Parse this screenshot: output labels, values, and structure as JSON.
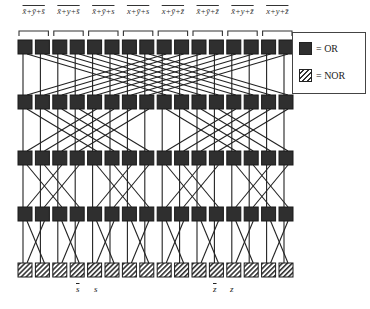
{
  "diagram": {
    "type": "butterfly logic network",
    "columns": 16,
    "rows": [
      {
        "kind": "OR",
        "y": 40
      },
      {
        "kind": "OR",
        "y": 95
      },
      {
        "kind": "OR",
        "y": 151
      },
      {
        "kind": "OR",
        "y": 207
      },
      {
        "kind": "NOR",
        "y": 263
      }
    ],
    "gate_size": 14,
    "x0": 18,
    "pitch": 17.4,
    "colors": {
      "or_fill": "#2f2f2f",
      "line": "#222222",
      "nor_hatch": "#333333"
    }
  },
  "top_labels": [
    "x̄+ȳ+s̄",
    "x̄+y+s̄",
    "x̄+ȳ+s",
    "x+ȳ+s",
    "x+ȳ+z̄",
    "x̄+ȳ+z̄",
    "x̄+y+z̄",
    "x+y+z̄"
  ],
  "bottom_labels": [
    {
      "text": "s",
      "bar": true,
      "x": 76
    },
    {
      "text": "s",
      "bar": false,
      "x": 94
    },
    {
      "text": "z",
      "bar": true,
      "x": 213
    },
    {
      "text": "z",
      "bar": false,
      "x": 230
    }
  ],
  "legend": {
    "items": [
      {
        "swatch": "or",
        "label": "= OR"
      },
      {
        "swatch": "nor",
        "label": "= NOR"
      }
    ]
  }
}
